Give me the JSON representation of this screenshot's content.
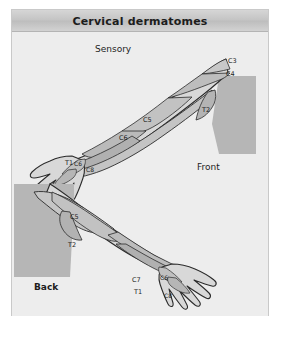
{
  "panel": {
    "title": "Cervical dermatomes",
    "background_color": "#ececec",
    "border_color": "#c9c9c9",
    "title_bar_color": "#c4c4c4"
  },
  "illustration": {
    "type": "anatomical-diagram",
    "subject": "cervical dermatomes of the upper limb",
    "skin_fill": "#d8d8d8",
    "band_fill": "#bcbcbc",
    "torso_fill": "#b6b6b6",
    "outline_color": "#2b2b2b",
    "views": [
      {
        "name": "upper-figure",
        "caption": "Sensory",
        "orientation_label": "Front",
        "description": "right arm abducted, palmar/anterior aspect, shoulder at right"
      },
      {
        "name": "lower-figure",
        "caption": "",
        "orientation_label": "Back",
        "description": "right arm abducted, dorsal/posterior aspect, shoulder at left"
      }
    ],
    "dermatome_labels_upper": [
      "C3",
      "C4",
      "C5",
      "C6",
      "C6",
      "C8",
      "T1",
      "T2"
    ],
    "dermatome_labels_lower": [
      "C5",
      "T2",
      "C7",
      "T1",
      "C6",
      "C8"
    ]
  },
  "labels": {
    "sensory": "Sensory",
    "front": "Front",
    "back": "Back",
    "c3": "C3",
    "c4": "C4",
    "c5": "C5",
    "c6": "C6",
    "c7": "C7",
    "c8": "C8",
    "t1": "T1",
    "t2": "T2"
  }
}
